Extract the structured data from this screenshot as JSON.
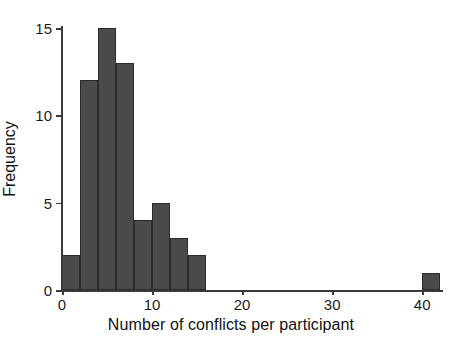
{
  "chart_data": {
    "type": "bar",
    "title": "",
    "subtitle": "",
    "xlabel": "Number of conflicts per participant",
    "ylabel": "Frequency",
    "xlim": [
      0,
      42.2
    ],
    "ylim": [
      0,
      15
    ],
    "grid": false,
    "legend": null,
    "bar_color": "#4a4a4a",
    "bar_edge_color": "#2b2b2b",
    "binning": "histogram, bin width 2",
    "xticks": [
      {
        "value": 0,
        "label": "0"
      },
      {
        "value": 10,
        "label": "10"
      },
      {
        "value": 20,
        "label": "20"
      },
      {
        "value": 30,
        "label": "30"
      },
      {
        "value": 40,
        "label": "40"
      }
    ],
    "yticks": [
      {
        "value": 0,
        "label": "0"
      },
      {
        "value": 5,
        "label": "5"
      },
      {
        "value": 10,
        "label": "10"
      },
      {
        "value": 15,
        "label": "15"
      }
    ],
    "bins": [
      {
        "start": 0,
        "end": 2,
        "center": 1,
        "count": 2
      },
      {
        "start": 2,
        "end": 4,
        "center": 3,
        "count": 12
      },
      {
        "start": 4,
        "end": 6,
        "center": 5,
        "count": 15
      },
      {
        "start": 6,
        "end": 8,
        "center": 7,
        "count": 13
      },
      {
        "start": 8,
        "end": 10,
        "center": 9,
        "count": 4
      },
      {
        "start": 10,
        "end": 12,
        "center": 11,
        "count": 5
      },
      {
        "start": 12,
        "end": 14,
        "center": 13,
        "count": 3
      },
      {
        "start": 14,
        "end": 16,
        "center": 15,
        "count": 2
      },
      {
        "start": 40,
        "end": 42,
        "center": 41,
        "count": 1
      }
    ],
    "categories": [
      "0-2",
      "2-4",
      "4-6",
      "6-8",
      "8-10",
      "10-12",
      "12-14",
      "14-16",
      "40-42"
    ],
    "values": [
      2,
      12,
      15,
      13,
      4,
      5,
      3,
      2,
      1
    ]
  }
}
